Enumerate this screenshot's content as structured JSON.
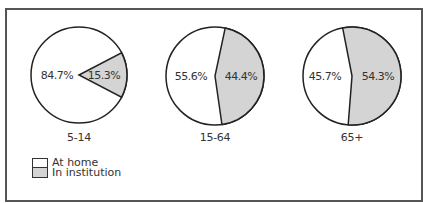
{
  "chart_data": {
    "type": "pie",
    "title": "",
    "colors": {
      "at_home": "#ffffff",
      "in_institution": "#d4d4d4",
      "stroke": "#222222",
      "frame": "#555555"
    },
    "legend": {
      "position": "bottom-left",
      "entries": [
        {
          "label": "At home",
          "color": "#ffffff"
        },
        {
          "label": "In institution",
          "color": "#d4d4d4"
        }
      ]
    },
    "pies": [
      {
        "category": "5-14",
        "slices": [
          {
            "label": "At home",
            "value": 84.7,
            "text": "84.7%"
          },
          {
            "label": "In institution",
            "value": 15.3,
            "text": "15.3%"
          }
        ]
      },
      {
        "category": "15-64",
        "slices": [
          {
            "label": "At home",
            "value": 55.6,
            "text": "55.6%"
          },
          {
            "label": "In institution",
            "value": 44.4,
            "text": "44.4%"
          }
        ]
      },
      {
        "category": "65+",
        "slices": [
          {
            "label": "At home",
            "value": 45.7,
            "text": "45.7%"
          },
          {
            "label": "In institution",
            "value": 54.3,
            "text": "54.3%"
          }
        ]
      }
    ]
  },
  "layout": {
    "pies": [
      {
        "cx": 79,
        "cy": 75,
        "r": 48,
        "start_deg": 62.5,
        "home_lx": 57,
        "inst_lx": 104,
        "cat_y": 141
      },
      {
        "cx": 215,
        "cy": 76,
        "r": 49,
        "start_deg": 12,
        "home_lx": 191,
        "inst_lx": 241,
        "cat_y": 141
      },
      {
        "cx": 352,
        "cy": 76,
        "r": 49,
        "start_deg": -11,
        "home_lx": 325,
        "inst_lx": 378,
        "cat_y": 141
      }
    ]
  }
}
